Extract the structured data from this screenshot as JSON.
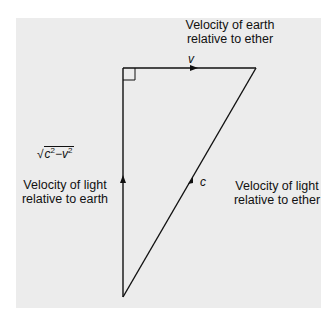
{
  "diagram": {
    "labels": {
      "earth_velocity_line1": "Velocity of earth",
      "earth_velocity_line2": "relative to ether",
      "light_earth_line1": "Velocity of light",
      "light_earth_line2": "relative to earth",
      "light_ether_line1": "Velocity of light",
      "light_ether_line2": "relative to ether"
    },
    "symbols": {
      "v": "v",
      "c": "c",
      "sqrt_c": "c",
      "sqrt_v": "v",
      "sqrt_exp": "2",
      "sqrt_minus": "−",
      "radical": "√"
    },
    "geometry": {
      "right_angle_corner": [
        123,
        68
      ],
      "top_right_vertex": [
        256,
        68
      ],
      "bottom_vertex": [
        123,
        297
      ]
    },
    "colors": {
      "line": "#111111",
      "background": "#ececec"
    }
  }
}
